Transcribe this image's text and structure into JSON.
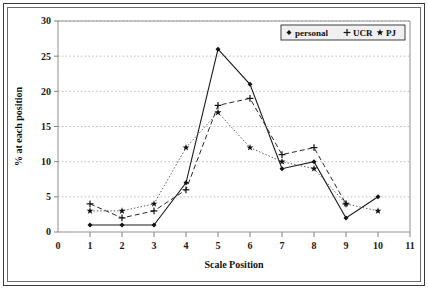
{
  "chart_data": {
    "type": "line",
    "title": "",
    "xlabel": "Scale Position",
    "ylabel": "% at each position",
    "xlim": [
      0,
      11
    ],
    "ylim": [
      0,
      30
    ],
    "xticks": [
      "0",
      "1",
      "2",
      "3",
      "4",
      "5",
      "6",
      "7",
      "8",
      "9",
      "10",
      "11"
    ],
    "yticks": [
      "0",
      "5",
      "10",
      "15",
      "20",
      "25",
      "30"
    ],
    "grid": "horizontal-dotted",
    "legend_position": "top-right-inside",
    "x": [
      1,
      2,
      3,
      4,
      5,
      6,
      7,
      8,
      9,
      10
    ],
    "series": [
      {
        "name": "personal",
        "marker": "filled-diamond",
        "line_style": "solid",
        "values": [
          1,
          1,
          1,
          7,
          26,
          21,
          9,
          10,
          2,
          5
        ]
      },
      {
        "name": "UCR",
        "marker": "plus",
        "line_style": "dashed",
        "values": [
          4,
          2,
          3,
          6,
          18,
          19,
          11,
          12,
          4,
          null
        ]
      },
      {
        "name": "PJ",
        "marker": "star",
        "line_style": "dotted",
        "values": [
          3,
          3,
          4,
          12,
          17,
          12,
          10,
          9,
          4,
          3
        ]
      }
    ]
  },
  "legend": {
    "entries": [
      {
        "label": "personal",
        "glyph": "diamond-marker-icon"
      },
      {
        "label": "UCR",
        "glyph": "plus-marker-icon"
      },
      {
        "label": "PJ",
        "glyph": "star-marker-icon"
      }
    ]
  },
  "colors": {
    "line": "#111111",
    "grid": "#b0b0b0",
    "axis": "#909090",
    "legend_fill": "#f0f0f0",
    "frame_outer": "#3a3a3a",
    "frame_inner": "#6b6b6b",
    "background": "#ffffff"
  }
}
